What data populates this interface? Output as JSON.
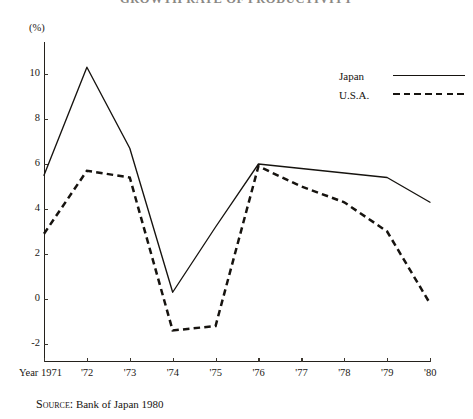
{
  "title": "GROWTH RATE OF PRODUCTIVITY",
  "unit_label": "(%)",
  "legend": {
    "position": "top-right",
    "entries": [
      {
        "label": "Japan",
        "style": "solid",
        "swatch": "solid-line-swatch"
      },
      {
        "label": "U.S.A.",
        "style": "dashed",
        "swatch": "dashed-line-swatch"
      }
    ]
  },
  "source": {
    "prefix": "Source:",
    "text": "Bank of Japan  1980"
  },
  "axes": {
    "y_ticks": [
      "10",
      "8",
      "6",
      "4",
      "2",
      "0",
      "-2"
    ],
    "x_ticks": [
      "Year 1971",
      "'72",
      "'73",
      "'74",
      "'75",
      "'76",
      "'77",
      "'78",
      "'79",
      "'80"
    ]
  },
  "chart_data": {
    "type": "line",
    "title": "GROWTH RATE OF PRODUCTIVITY",
    "xlabel": "Year",
    "ylabel": "(%)",
    "ylim": [
      -3,
      11.5
    ],
    "yticks": [
      10,
      8,
      6,
      4,
      2,
      0,
      -2
    ],
    "grid": false,
    "legend_position": "top-right",
    "categories": [
      "1971",
      "1972",
      "1973",
      "1974",
      "1975",
      "1976",
      "1977",
      "1978",
      "1979",
      "1980"
    ],
    "x_tick_labels": [
      "Year 1971",
      "'72",
      "'73",
      "'74",
      "'75",
      "'76",
      "'77",
      "'78",
      "'79",
      "'80"
    ],
    "series": [
      {
        "name": "Japan",
        "style": "solid",
        "color": "#16130f",
        "values": [
          5.5,
          10.3,
          6.7,
          0.3,
          3.2,
          6.0,
          5.8,
          5.6,
          5.4,
          4.3
        ]
      },
      {
        "name": "U.S.A.",
        "style": "dashed",
        "color": "#16130f",
        "values": [
          2.9,
          5.7,
          5.4,
          -1.4,
          -1.2,
          5.9,
          5.0,
          4.3,
          3.0,
          -0.2
        ]
      }
    ],
    "source": "Source: Bank of Japan  1980"
  }
}
